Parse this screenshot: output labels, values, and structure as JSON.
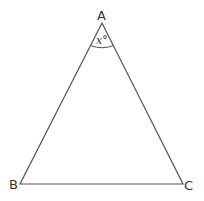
{
  "diagram": {
    "type": "triangle",
    "vertices": {
      "A": {
        "label": "A",
        "x": 102,
        "y": 23
      },
      "B": {
        "label": "B",
        "x": 20,
        "y": 184
      },
      "C": {
        "label": "C",
        "x": 183,
        "y": 184
      }
    },
    "angle_A": {
      "label": "x°"
    },
    "stroke_color": "#555555"
  }
}
